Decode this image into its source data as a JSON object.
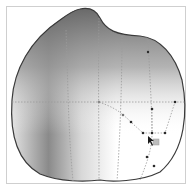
{
  "canvas": {
    "shape": "peach-like mesh-gradient object",
    "colors": {
      "outline": "#3a3a3a",
      "shade_dark": "#6a6a6a",
      "shade_light": "#ffffff",
      "grid": "#9a9a9a",
      "node": "#2a2a2a",
      "frame": "#cfcfcf",
      "selected_marker": "#bdbdbd"
    },
    "mesh_nodes": [
      {
        "x": 99,
        "y": 102
      },
      {
        "x": 175,
        "y": 102
      },
      {
        "x": 148,
        "y": 52
      },
      {
        "x": 123,
        "y": 115
      },
      {
        "x": 131,
        "y": 122
      },
      {
        "x": 143,
        "y": 133
      },
      {
        "x": 152,
        "y": 133
      },
      {
        "x": 165,
        "y": 133
      },
      {
        "x": 152,
        "y": 109
      },
      {
        "x": 147,
        "y": 157
      },
      {
        "x": 154,
        "y": 166
      }
    ]
  }
}
